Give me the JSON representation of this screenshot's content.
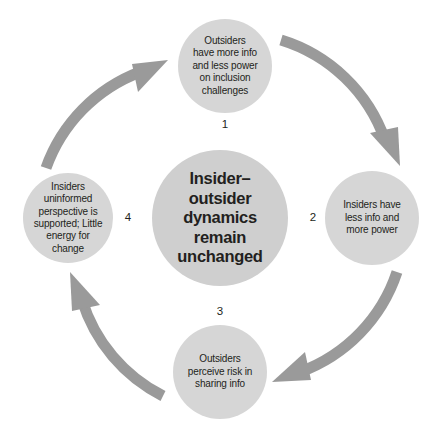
{
  "diagram": {
    "colors": {
      "node_fill": "#d6d6d6",
      "center_fill": "#cfcfcf",
      "arrow": "#9a9a9a",
      "text": "#231f20",
      "background": "#ffffff"
    },
    "center": {
      "label": "Insider–\noutsider\ndynamics\nremain\nunchanged",
      "cx": 220,
      "cy": 218,
      "r": 68
    },
    "nodes": [
      {
        "number": "1",
        "label": "Outsiders\nhave more info\nand less power\non inclusion\nchallenges",
        "cx": 225,
        "cy": 66,
        "r": 47,
        "number_x": 225,
        "number_y": 125
      },
      {
        "number": "2",
        "label": "Insiders have\nless info and\nmore power",
        "cx": 372,
        "cy": 218,
        "r": 47,
        "number_x": 313,
        "number_y": 218
      },
      {
        "number": "3",
        "label": "Outsiders\nperceive risk in\nsharing info",
        "cx": 220,
        "cy": 372,
        "r": 47,
        "number_x": 220,
        "number_y": 312
      },
      {
        "number": "4",
        "label": "Insiders\nuninformed\nperspective is\nsupported; Little\nenergy for\nchange",
        "cx": 68,
        "cy": 218,
        "r": 45,
        "number_x": 128,
        "number_y": 218
      }
    ],
    "arrows": [
      {
        "name": "arrow-1-to-2",
        "from": "1",
        "to": "2"
      },
      {
        "name": "arrow-2-to-3",
        "from": "2",
        "to": "3"
      },
      {
        "name": "arrow-3-to-4",
        "from": "3",
        "to": "4"
      },
      {
        "name": "arrow-4-to-1",
        "from": "4",
        "to": "1"
      }
    ]
  }
}
